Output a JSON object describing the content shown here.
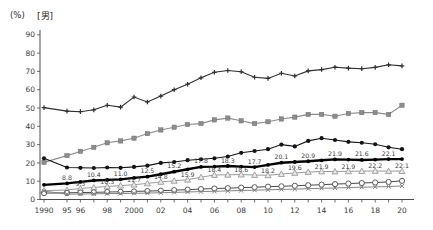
{
  "page": {
    "background": "#ffffff"
  },
  "chart_data": {
    "type": "line",
    "unit_label": "(%)",
    "group_label": "[男]",
    "title": "",
    "xlabel": "",
    "ylabel": "(%)",
    "ylim": [
      0,
      90
    ],
    "ytick_step": 10,
    "grid": false,
    "legend_position": "none",
    "axis_color": "#4a4a4a",
    "tick_label_color": "#3a3a3a",
    "data_label_color": "#3a3a3a",
    "x_categories": [
      "1990",
      "95",
      "96",
      "97",
      "98",
      "99",
      "2000",
      "01",
      "02",
      "03",
      "04",
      "05",
      "06",
      "07",
      "08",
      "09",
      "10",
      "11",
      "12",
      "13",
      "14",
      "15",
      "16",
      "17",
      "18",
      "19",
      "20"
    ],
    "x_tick_labels_shown": {
      "0": "1990",
      "1": "95",
      "2": "96",
      "4": "98",
      "6": "2000",
      "8": "02",
      "10": "04",
      "12": "06",
      "14": "08",
      "16": "10",
      "18": "12",
      "20": "14",
      "22": "16",
      "24": "18",
      "26": "20"
    },
    "series": [
      {
        "name": "line-1-top-plus",
        "marker": "plus",
        "color": "#2f2f2f",
        "line_width": 1.1,
        "values": [
          50.2,
          48.3,
          48.0,
          49.0,
          51.5,
          50.5,
          56.0,
          53.3,
          56.5,
          60.0,
          63.0,
          66.5,
          69.5,
          70.5,
          69.8,
          66.8,
          66.2,
          69.0,
          67.5,
          70.3,
          71.0,
          72.3,
          71.8,
          71.5,
          72.2,
          73.6,
          73.0
        ]
      },
      {
        "name": "line-2-gray-squares",
        "marker": "square",
        "color": "#8c8c8c",
        "line_width": 1.1,
        "values": [
          20.3,
          24.0,
          26.3,
          28.5,
          31.0,
          32.0,
          33.5,
          36.0,
          38.0,
          39.5,
          41.0,
          41.5,
          43.5,
          44.5,
          43.0,
          41.5,
          42.5,
          44.0,
          45.0,
          46.5,
          46.5,
          45.5,
          47.0,
          47.5,
          47.5,
          46.5,
          51.5
        ]
      },
      {
        "name": "line-3-black-dots",
        "marker": "dot",
        "color": "#141414",
        "line_width": 1.1,
        "values": [
          22.5,
          17.5,
          17.3,
          17.2,
          17.5,
          17.3,
          17.8,
          18.5,
          20.0,
          20.5,
          21.5,
          22.0,
          22.5,
          23.5,
          25.5,
          26.5,
          27.5,
          30.0,
          29.0,
          32.0,
          33.5,
          32.5,
          31.5,
          31.0,
          30.2,
          28.5,
          27.5
        ]
      },
      {
        "name": "line-4-bold-black",
        "marker": "dot-small",
        "color": "#000000",
        "line_width": 2.4,
        "values": [
          8.0,
          8.8,
          9.6,
          10.4,
          10.7,
          11.0,
          11.8,
          12.5,
          13.8,
          15.2,
          16.5,
          17.8,
          18.0,
          18.3,
          18.0,
          17.7,
          18.9,
          20.1,
          20.5,
          20.9,
          21.4,
          21.9,
          21.8,
          21.6,
          21.8,
          22.1,
          22.1
        ],
        "point_labels": {
          "indices": [
            1,
            3,
            5,
            7,
            9,
            11,
            13,
            15,
            17,
            19,
            21,
            23,
            25
          ],
          "texts": [
            "8.8",
            "10.4",
            "11.0",
            "12.5",
            "15.2",
            "17.8",
            "18.3",
            "17.7",
            "20.1",
            "20.9",
            "21.9",
            "21.6",
            "22.1"
          ],
          "position": "above"
        }
      },
      {
        "name": "line-5-gray-triangles",
        "marker": "triangle",
        "color": "#9a9a9a",
        "line_width": 1.0,
        "values": [
          4.8,
          5.2,
          6.0,
          6.6,
          7.1,
          7.6,
          8.1,
          8.8,
          9.6,
          10.2,
          10.8,
          12.2,
          13.4,
          13.5,
          13.6,
          13.4,
          13.2,
          13.9,
          14.5,
          15.0,
          15.3,
          15.3,
          15.4,
          15.5,
          15.6,
          15.5,
          15.5
        ],
        "point_labels": {
          "indices": [
            2,
            4,
            6,
            8,
            10,
            12,
            14,
            16,
            18,
            20,
            22,
            24,
            26
          ],
          "texts": [
            "9.3",
            "10.3",
            "11.7",
            "14.8",
            "15.9",
            "18.4",
            "18.6",
            "18.2",
            "19.6",
            "21.9",
            "21.9",
            "22.2",
            "22.1"
          ],
          "position": "below"
        }
      },
      {
        "name": "line-6-open-circles",
        "marker": "circle-open",
        "color": "#4a4a4a",
        "line_width": 1.0,
        "values": [
          3.5,
          3.6,
          3.8,
          3.9,
          4.1,
          4.2,
          4.4,
          4.6,
          4.8,
          5.1,
          5.4,
          5.7,
          6.0,
          6.2,
          6.5,
          6.7,
          7.0,
          7.2,
          7.5,
          7.8,
          8.1,
          8.4,
          8.7,
          9.0,
          9.3,
          9.6,
          10.2
        ]
      },
      {
        "name": "line-7-x-marks",
        "marker": "x",
        "color": "#858585",
        "line_width": 1.0,
        "values": [
          4.6,
          2.9,
          3.0,
          3.1,
          3.2,
          3.3,
          3.4,
          3.5,
          3.7,
          3.9,
          4.1,
          4.3,
          4.5,
          4.7,
          4.9,
          5.1,
          5.3,
          5.5,
          5.7,
          5.9,
          6.1,
          6.3,
          6.5,
          6.7,
          6.9,
          7.1,
          7.4
        ]
      }
    ]
  }
}
